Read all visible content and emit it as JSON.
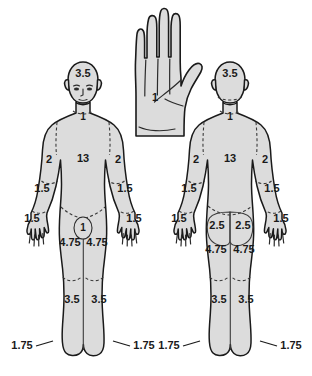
{
  "diagram": {
    "type": "body-surface-area-chart",
    "background_color": "#ffffff",
    "body_fill_color": "#dcdcdc",
    "outline_color": "#1a1a1a",
    "text_color": "#1a1a1a"
  },
  "hand_reference": {
    "name": "hand-palm-reference",
    "value": "1"
  },
  "anterior_figure": {
    "name": "anterior-body-figure",
    "regions": {
      "head": "3.5",
      "neck": "1",
      "trunk": "13",
      "upper_arm_left": "2",
      "upper_arm_right": "2",
      "forearm_left": "1.5",
      "forearm_right": "1.5",
      "hand_left": "1.5",
      "hand_right": "1.5",
      "genitalia": "1",
      "thigh_left": "4.75",
      "thigh_right": "4.75",
      "leg_left": "3.5",
      "leg_right": "3.5",
      "foot_left": "1.75",
      "foot_right": "1.75"
    }
  },
  "posterior_figure": {
    "name": "posterior-body-figure",
    "regions": {
      "head": "3.5",
      "neck": "1",
      "trunk": "13",
      "upper_arm_left": "2",
      "upper_arm_right": "2",
      "forearm_left": "1.5",
      "forearm_right": "1.5",
      "hand_left": "1.5",
      "hand_right": "1.5",
      "buttock_left": "2.5",
      "buttock_right": "2.5",
      "thigh_left": "4.75",
      "thigh_right": "4.75",
      "leg_left": "3.5",
      "leg_right": "3.5",
      "foot_left": "1.75",
      "foot_right": "1.75"
    }
  }
}
